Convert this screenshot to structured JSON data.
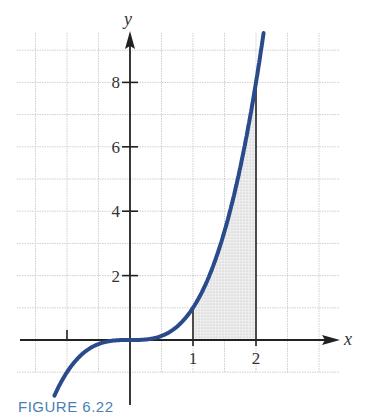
{
  "chart_data": {
    "type": "line",
    "title": "",
    "function": "y = x^3",
    "xlabel": "x",
    "ylabel": "y",
    "xlim": [
      -2.0,
      3.3
    ],
    "ylim": [
      -1.6,
      9.5
    ],
    "x_ticks": [
      {
        "value": -1,
        "label": ""
      },
      {
        "value": 1,
        "label": "1"
      },
      {
        "value": 2,
        "label": "2"
      }
    ],
    "y_ticks": [
      {
        "value": 2,
        "label": "2"
      },
      {
        "value": 4,
        "label": "4"
      },
      {
        "value": 6,
        "label": "6"
      },
      {
        "value": 8,
        "label": "8"
      }
    ],
    "grid": true,
    "grid_x_step": 0.5,
    "grid_y_step": 1,
    "series": [
      {
        "name": "y = x^3",
        "x": [
          -1.2,
          -1.0,
          -0.5,
          0,
          0.5,
          1.0,
          1.5,
          2.0,
          2.1
        ],
        "y": [
          -1.728,
          -1.0,
          -0.125,
          0,
          0.125,
          1.0,
          3.375,
          8.0,
          9.261
        ],
        "color": "#2b4a8c"
      }
    ],
    "shaded_region": {
      "from_x": 1,
      "to_x": 2,
      "under": "y = x^3",
      "fill": "#e3e3e3"
    },
    "vertical_segments": [
      {
        "x": 1,
        "y_top": 1
      },
      {
        "x": 2,
        "y_top": 8
      }
    ],
    "caption": "FIGURE 6.22"
  }
}
